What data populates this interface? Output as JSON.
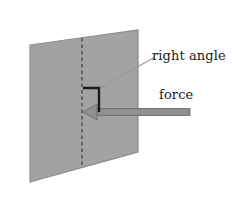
{
  "figure": {
    "width": 232,
    "height": 199,
    "background_color": "#ffffff"
  },
  "labels": {
    "right_angle": "right angle",
    "force": "force"
  },
  "colors": {
    "plane_fill": "#a3a3a3",
    "plane_edge": "#8a8a8a",
    "arrow_fill": "#8f8f8f",
    "arrow_edge": "#6f6f6f",
    "marker_stroke": "#1a1a1a",
    "dashed_line": "#2b2b2b",
    "leader_line": "#9a9a9a",
    "text": "#1a1a1a"
  },
  "shapes": {
    "plane": {
      "name": "plane-surface",
      "points": "30,45 138,30 138,152 30,182"
    },
    "dashed_center_line": {
      "name": "dashed-center-line",
      "x": 82,
      "y_top": 38,
      "y_bottom": 167
    },
    "right_angle_marker": {
      "name": "right-angle-marker",
      "path": "M 83 88 L 99 88 L 99 112"
    },
    "force_arrow": {
      "name": "force-arrow",
      "tip_x": 83,
      "tip_y": 112,
      "tail_x": 190,
      "shaft_half_height": 3.5,
      "head_half_height": 8,
      "head_length": 14
    },
    "leader_line": {
      "name": "right-angle-leader-line",
      "x1": 155,
      "y1": 57,
      "x2": 100,
      "y2": 88
    }
  }
}
